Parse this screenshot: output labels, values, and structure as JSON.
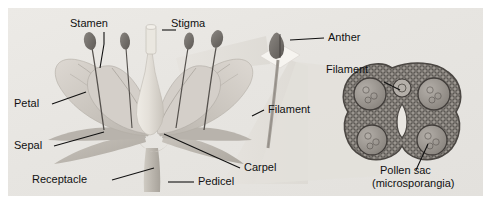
{
  "figure": {
    "panel_background": "#eceae6",
    "ink_color": "#111111"
  },
  "labels": {
    "stamen": "Stamen",
    "stigma": "Stigma",
    "petal": "Petal",
    "sepal": "Sepal",
    "receptacle": "Receptacle",
    "pedicel": "Pedicel",
    "carpel": "Carpel",
    "anther": "Anther",
    "filament_stem": "Filament",
    "filament_section": "Filament",
    "pollen_sac_line1": "Pollen sac",
    "pollen_sac_line2": "(microsporangia)"
  },
  "parts": {
    "flower": {
      "name": "whole-flower-cutaway",
      "petal_color": "#cfcac4",
      "sepal_color": "#c2bdb6",
      "carpel_color": "#e2ded7",
      "anther_color": "#6f6a66",
      "stem_color": "#bdb9b1"
    },
    "anther_closeup": {
      "name": "anther-magnified",
      "card_color": "#f4f2ee",
      "anther_color": "#585450"
    },
    "cross_section": {
      "name": "anther-cross-section",
      "outline_color": "#55514d",
      "fill_color": "#9a958f",
      "pollen_sac_count": 4
    },
    "beams": {
      "name": "magnification-beams",
      "color": "#dedbd6"
    }
  }
}
